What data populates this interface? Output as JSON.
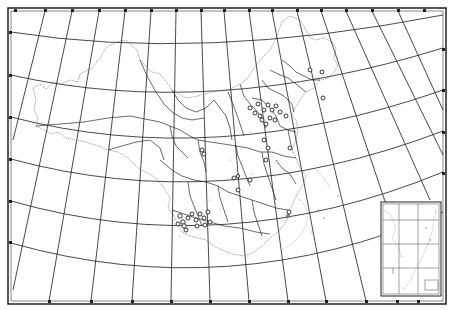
{
  "map": {
    "title": "",
    "type": "outline map of China with province boundaries and sampling sites",
    "projection": "conic (curved parallels, converging meridians)",
    "colors": {
      "background": "#ffffff",
      "graticule": "#1a1a1a",
      "province_boundary": "#2a2a2a",
      "national_boundary": "#555555",
      "site_marker": "#222222"
    },
    "frame": {
      "top_ticks": 17,
      "bottom_ticks": 11,
      "left_ticks": 6,
      "right_ticks": 4
    },
    "layers": [
      "graticule",
      "national-boundary",
      "province-boundaries",
      "sampling-sites",
      "south-china-sea-inset"
    ],
    "sites": {
      "count_approx": 45,
      "clusters": [
        {
          "region": "north (Hebei/Shanxi area)",
          "count_approx": 18
        },
        {
          "region": "central (Shaanxi/Henan area)",
          "count_approx": 6
        },
        {
          "region": "southwest (Sichuan/Chongqing area)",
          "count_approx": 14
        },
        {
          "region": "east-central (Jiangxi/Hunan area)",
          "count_approx": 3
        },
        {
          "region": "northeast (Liaoning/Jilin area)",
          "count_approx": 3
        }
      ]
    },
    "inset": {
      "label": "South China Sea islands inset",
      "position": "bottom-right",
      "scale_box_text": ""
    }
  }
}
